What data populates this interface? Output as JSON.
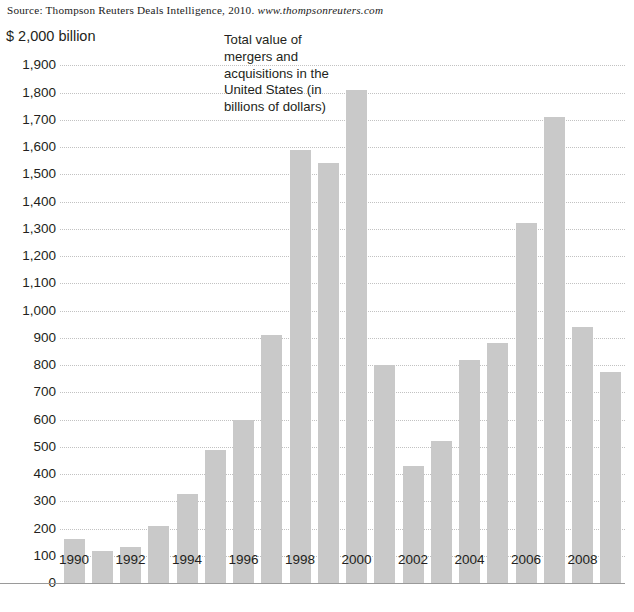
{
  "source": {
    "prefix": "Source: Thompson Reuters Deals Intelligence, 2010.",
    "url": "www.thompsonreuters.com"
  },
  "annotation": {
    "text": "Total value of mergers and acquisitions in the United States (in billions of dollars)"
  },
  "axis": {
    "y_top_label": "$ 2,000 billion",
    "y_ticks": [
      "1,900",
      "1,800",
      "1,700",
      "1,600",
      "1,500",
      "1,400",
      "1,300",
      "1,200",
      "1,100",
      "1,000",
      "900",
      "800",
      "700",
      "600",
      "500",
      "400",
      "300",
      "200",
      "100",
      "0"
    ],
    "x_ticks": [
      "1990",
      "1992",
      "1994",
      "1996",
      "1998",
      "2000",
      "2002",
      "2004",
      "2006",
      "2008"
    ]
  },
  "colors": {
    "bar": "#c9c9c9",
    "gridline": "#c2c2c2",
    "axis": "#9a9a9a",
    "text": "#231f20"
  },
  "chart_data": {
    "type": "bar",
    "title": "Total value of mergers and acquisitions in the United States (in billions of dollars)",
    "xlabel": "",
    "ylabel": "$ 2,000 billion",
    "ylim": [
      0,
      2000
    ],
    "ytick_step": 100,
    "grid": true,
    "legend": "none",
    "categories": [
      "1990",
      "1991",
      "1992",
      "1993",
      "1994",
      "1995",
      "1996",
      "1997",
      "1998",
      "1999",
      "2000",
      "2001",
      "2002",
      "2003",
      "2004",
      "2005",
      "2006",
      "2007",
      "2008",
      "2009"
    ],
    "values": [
      160,
      118,
      133,
      208,
      325,
      490,
      600,
      910,
      1590,
      1540,
      1810,
      800,
      430,
      520,
      820,
      880,
      1320,
      1710,
      940,
      775
    ],
    "labeled_categories": [
      "1990",
      "1992",
      "1994",
      "1996",
      "1998",
      "2000",
      "2002",
      "2004",
      "2006",
      "2008"
    ],
    "source": "Thompson Reuters Deals Intelligence, 2010. www.thompsonreuters.com"
  }
}
